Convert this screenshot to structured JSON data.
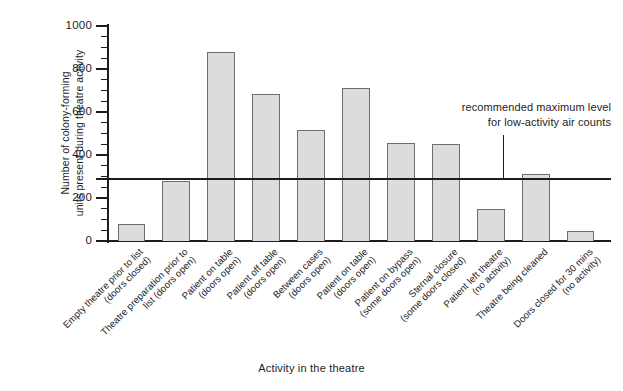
{
  "chart_data": {
    "type": "bar",
    "title": "",
    "xlabel": "Activity in the theatre",
    "ylabel": "Number of colony-forming units present during theatre activity",
    "ylabel_line1": "Number of colony-forming",
    "ylabel_line2": "units present during theatre activity",
    "ylim": [
      0,
      1000
    ],
    "ytick_step_major": 200,
    "ytick_step_minor": 50,
    "ytick_labels": [
      "0",
      "200",
      "400",
      "600",
      "800",
      "1000"
    ],
    "ytick_values": [
      0,
      200,
      400,
      600,
      800,
      1000
    ],
    "grid": false,
    "legend": "none",
    "bar_fill": "#dcdcdc",
    "bar_edge": "#6e6e6e",
    "axis_color": "#1d1d1d",
    "categories": [
      "Empty theatre prior to list (doors closed)",
      "Theatre preparation prior to list (doors open)",
      "Patient on table (doors open)",
      "Patient off table (doors open)",
      "Between cases (doors open)",
      "Patient on table (doors open)",
      "Patient on bypass (some doors open)",
      "Sternal closure (some doors closed)",
      "Patient left theatre (no activity)",
      "Theatre being cleaned",
      "Doors closed for 30 mins (no activity)"
    ],
    "category_lines": [
      [
        "Empty theatre prior to list",
        "(doors closed)"
      ],
      [
        "Theatre preparation prior to",
        "list (doors open)"
      ],
      [
        "Patient on table",
        "(doors open)"
      ],
      [
        "Patient off table",
        "(doors open)"
      ],
      [
        "Between cases",
        "(doors open)"
      ],
      [
        "Patient on table",
        "(doors open)"
      ],
      [
        "Patient on bypass",
        "(some doors open)"
      ],
      [
        "Sternal closure",
        "(some doors closed)"
      ],
      [
        "Patient left theatre",
        "(no activity)"
      ],
      [
        "Theatre being cleaned",
        ""
      ],
      [
        "Doors closed for 30 mins",
        "(no activity)"
      ]
    ],
    "values": [
      80,
      280,
      880,
      685,
      515,
      710,
      455,
      450,
      150,
      310,
      45
    ],
    "annotations": [
      {
        "text": "recommended maximum level for low-activity air counts",
        "line1": "recommended maximum level",
        "line2": "for low-activity air counts",
        "threshold_value": 290
      }
    ]
  }
}
